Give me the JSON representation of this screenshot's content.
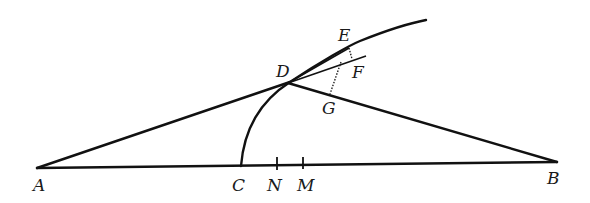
{
  "diagram": {
    "type": "geometry-construction",
    "points": {
      "A": {
        "label": "A",
        "x": 37,
        "y": 168
      },
      "B": {
        "label": "B",
        "x": 557,
        "y": 162
      },
      "C": {
        "label": "C",
        "x": 241,
        "y": 167
      },
      "N": {
        "label": "N",
        "x": 277,
        "y": 165
      },
      "M": {
        "label": "M",
        "x": 303,
        "y": 165
      },
      "D": {
        "label": "D",
        "x": 288,
        "y": 83
      },
      "E": {
        "label": "E",
        "x": 349,
        "y": 47
      },
      "F": {
        "label": "F",
        "x": 355,
        "y": 60
      },
      "G": {
        "label": "G",
        "x": 330,
        "y": 95
      }
    },
    "segments": [
      "AB",
      "AD",
      "DB",
      "DE",
      "DF"
    ],
    "dotted_segments": [
      "EG",
      "EF"
    ],
    "arcs": [
      "C-D-E arc"
    ],
    "ticks": [
      "N",
      "M"
    ],
    "colors": {
      "stroke": "#111111",
      "background": "#ffffff"
    }
  }
}
